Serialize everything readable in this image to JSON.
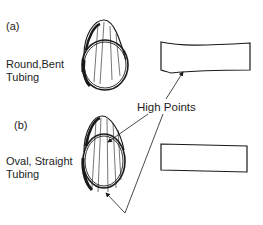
{
  "diagram": {
    "panel_a": {
      "letter": "(a)",
      "label_line1": "Round,Bent",
      "label_line2": "Tubing"
    },
    "panel_b": {
      "letter": "(b)",
      "label_line1": "Oval, Straight",
      "label_line2": "Tubing"
    },
    "callout": "High Points"
  }
}
